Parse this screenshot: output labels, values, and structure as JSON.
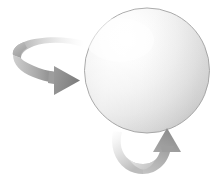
{
  "figure": {
    "name": "rotating-sphere-diagram",
    "title": "Sphere with two curved rotation arrows",
    "canvas": {
      "width": 216,
      "height": 181,
      "background": "#ffffff"
    },
    "sphere": {
      "name": "sphere",
      "cx": 147,
      "cy": 70.5,
      "r": 62.5,
      "highlight_color": "#ffffff",
      "mid_color": "#ededed",
      "edge_color": "#c2c2c2",
      "rim_color": "#b4b4b4",
      "outline_color": "#9e9e9e",
      "highlight_cx": 120,
      "highlight_cy": 40
    },
    "arrows": [
      {
        "name": "left-rotation-arrow",
        "direction": "right",
        "label": "counter-clockwise top sweep",
        "ribbon_light": "#fdfdfd",
        "ribbon_mid": "#d2d2d2",
        "ribbon_dark": "#9a9a9a",
        "head_color": "#8c8c8c",
        "head_dark": "#7d7d7d"
      },
      {
        "name": "bottom-rotation-arrow",
        "direction": "up",
        "label": "under sweep returning upward",
        "ribbon_light": "#fcfcfc",
        "ribbon_mid": "#dcdcdc",
        "ribbon_dark": "#a8a8a8",
        "head_color": "#9a9a9a",
        "head_dark": "#8a8a8a"
      }
    ]
  }
}
